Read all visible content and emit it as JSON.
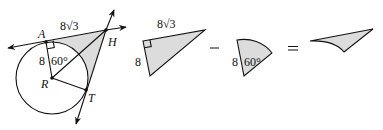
{
  "figure": {
    "points": {
      "A": "A",
      "H": "H",
      "R": "R",
      "T": "T"
    },
    "labels": {
      "tangent_length": "8√3",
      "tangent_coef": "8",
      "radius": "8",
      "angle": "60°"
    },
    "equation": {
      "minus": "−",
      "equals": "="
    },
    "colors": {
      "stroke": "#111111",
      "shade": "#dcdcdc",
      "background": "#ffffff"
    }
  }
}
